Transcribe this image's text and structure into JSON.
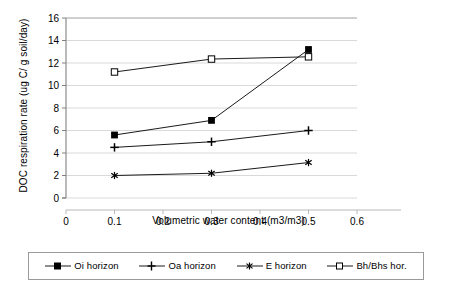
{
  "chart_data": {
    "type": "line",
    "title": "",
    "xlabel": "Volumetric water content (m3/m3)",
    "ylabel": "DOC respiration rate (ug C/ g soil/day)",
    "x": [
      0.1,
      0.3,
      0.5
    ],
    "xlim": [
      0,
      0.6
    ],
    "ylim": [
      0,
      16
    ],
    "xticks": [
      "0",
      "0.1",
      "0.2",
      "0.3",
      "0.4",
      "0.5",
      "0.6"
    ],
    "xtick_values": [
      0,
      0.1,
      0.2,
      0.3,
      0.4,
      0.5,
      0.6
    ],
    "yticks": [
      "0",
      "2",
      "4",
      "6",
      "8",
      "10",
      "12",
      "14",
      "16"
    ],
    "ytick_values": [
      0,
      2,
      4,
      6,
      8,
      10,
      12,
      14,
      16
    ],
    "grid": "horizontal",
    "legend_position": "bottom",
    "series": [
      {
        "name": "Oi horizon",
        "marker": "filled-square",
        "color": "#000000",
        "values": [
          5.6,
          6.9,
          13.2
        ]
      },
      {
        "name": "Oa horizon",
        "marker": "plus",
        "color": "#000000",
        "values": [
          4.5,
          5.0,
          6.0
        ]
      },
      {
        "name": "E horizon",
        "marker": "asterisk",
        "color": "#000000",
        "values": [
          2.0,
          2.2,
          3.15
        ]
      },
      {
        "name": "Bh/Bhs hor.",
        "marker": "open-square",
        "color": "#000000",
        "values": [
          11.2,
          12.35,
          12.55
        ]
      }
    ]
  },
  "legend": {
    "entries": [
      {
        "label": "Oi horizon",
        "marker": "filled-square-icon"
      },
      {
        "label": "Oa horizon",
        "marker": "plus-icon"
      },
      {
        "label": "E horizon",
        "marker": "asterisk-icon"
      },
      {
        "label": "Bh/Bhs hor.",
        "marker": "open-square-icon"
      }
    ]
  },
  "axes": {
    "x_title": "Volumetric water content (m3/m3)",
    "y_title": "DOC respiration rate (ug C/ g soil/day)"
  }
}
